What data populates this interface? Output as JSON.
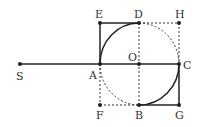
{
  "diagram": {
    "stroke_color": "#222222",
    "points": {
      "S": {
        "label": "S",
        "x": 20,
        "y": 64
      },
      "A": {
        "label": "A",
        "x": 100,
        "y": 64
      },
      "O": {
        "label": "O",
        "x": 139,
        "y": 64
      },
      "C": {
        "label": "C",
        "x": 179,
        "y": 64
      },
      "E": {
        "label": "E",
        "x": 100,
        "y": 23
      },
      "D": {
        "label": "D",
        "x": 139,
        "y": 23
      },
      "H": {
        "label": "H",
        "x": 179,
        "y": 23
      },
      "F": {
        "label": "F",
        "x": 100,
        "y": 105
      },
      "B": {
        "label": "B",
        "x": 139,
        "y": 105
      },
      "G": {
        "label": "G",
        "x": 179,
        "y": 105
      }
    },
    "solid_segments": [
      "SC",
      "AE",
      "ED",
      "CG",
      "GB"
    ],
    "dashed_segments": [
      "DH",
      "HC",
      "AF",
      "FB",
      "DB"
    ],
    "solid_arcs": [
      "A-D (center O)",
      "B-C (center O)"
    ],
    "dashed_arcs": [
      "D-C (center O)",
      "A-B (center O)"
    ]
  }
}
